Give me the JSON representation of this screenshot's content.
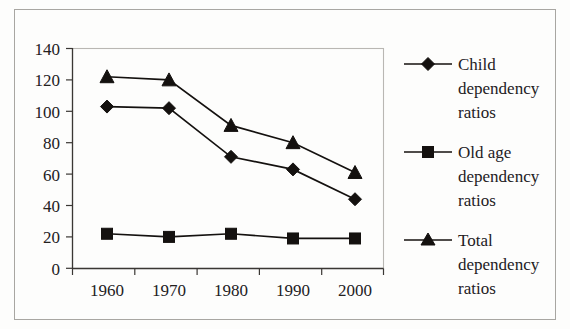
{
  "chart_data": {
    "type": "line",
    "title": "",
    "subtitle": "",
    "xlabel": "",
    "ylabel": "",
    "categories": [
      "1960",
      "1970",
      "1980",
      "1990",
      "2000"
    ],
    "x": [
      1960,
      1970,
      1980,
      1990,
      2000
    ],
    "ylim": [
      0,
      140
    ],
    "yticks": [
      "0",
      "20",
      "40",
      "60",
      "80",
      "100",
      "120",
      "140"
    ],
    "ytick_values": [
      0,
      20,
      40,
      60,
      80,
      100,
      120,
      140
    ],
    "grid": false,
    "legend_position": "right",
    "series": [
      {
        "name": "Child dependency ratios",
        "name_lines": [
          "Child",
          "dependency",
          "ratios"
        ],
        "marker": "diamond",
        "color": "#14110f",
        "values": [
          103,
          102,
          71,
          63,
          44
        ]
      },
      {
        "name": "Old age dependency ratios",
        "name_lines": [
          "Old age",
          "dependency",
          "ratios"
        ],
        "marker": "square",
        "color": "#14110f",
        "values": [
          22,
          20,
          22,
          19,
          19
        ]
      },
      {
        "name": "Total dependency ratios",
        "name_lines": [
          "Total",
          "dependency",
          "ratios"
        ],
        "marker": "triangle",
        "color": "#14110f",
        "values": [
          122,
          120,
          91,
          80,
          61
        ]
      }
    ]
  },
  "colors": {
    "ink": "#14110f",
    "axis": "#3a3734",
    "plot_border": "#b9b7b3",
    "frame": "#a8a6a2",
    "background": "#fdfdfc"
  }
}
